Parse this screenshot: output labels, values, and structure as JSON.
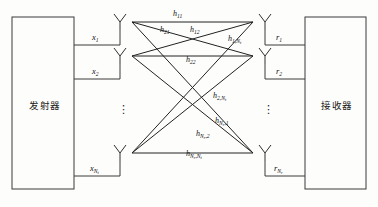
{
  "diagram": {
    "transmitter": {
      "label": "发射器"
    },
    "receiver": {
      "label": "接收器"
    },
    "tx_signals": [
      {
        "base": "x",
        "sub": "1"
      },
      {
        "base": "x",
        "sub": "2"
      },
      {
        "base": "x",
        "sub": "N",
        "subsub": "t"
      }
    ],
    "rx_signals": [
      {
        "base": "r",
        "sub": "1"
      },
      {
        "base": "r",
        "sub": "2"
      },
      {
        "base": "r",
        "sub": "N",
        "subsub": "r"
      }
    ],
    "channels": [
      {
        "name": "h-11",
        "base": "h",
        "sub": "11"
      },
      {
        "name": "h-21",
        "base": "h",
        "sub": "21"
      },
      {
        "name": "h-12",
        "base": "h",
        "sub": "12"
      },
      {
        "name": "h-1Nt",
        "base": "h",
        "sub": "1,N",
        "subsub": "t"
      },
      {
        "name": "h-22",
        "base": "h",
        "sub": "22"
      },
      {
        "name": "h-2Nt",
        "base": "h",
        "sub": "2,N",
        "subsub": "t"
      },
      {
        "name": "h-Nr1",
        "base": "h",
        "sub": "N",
        "subsub": "r",
        "subtail": ",1"
      },
      {
        "name": "h-Nr2",
        "base": "h",
        "sub": "N",
        "subsub": "r",
        "subtail": ",2"
      },
      {
        "name": "h-NrNt",
        "base": "h",
        "sub": "N",
        "subsub": "r",
        "subtail": ",N",
        "subsub2": "t"
      }
    ],
    "ellipsis": "⋮",
    "colors": {
      "line": "#222222",
      "box_border": "#3a3a3a",
      "text": "#111111",
      "background": "#fdfdfc"
    }
  }
}
